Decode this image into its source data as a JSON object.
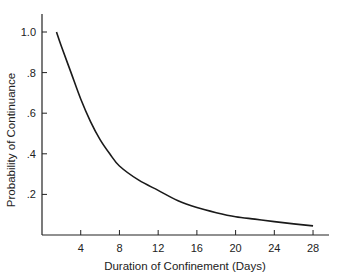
{
  "chart_data": {
    "type": "line",
    "title": "",
    "xlabel": "Duration of Confinement (Days)",
    "ylabel": "Probability of Continuance",
    "xlim": [
      0,
      29.5
    ],
    "ylim": [
      0,
      1.1
    ],
    "x_ticks": [
      4,
      8,
      12,
      16,
      20,
      24,
      28
    ],
    "x_tick_labels": [
      "4",
      "8",
      "12",
      "16",
      "20",
      "24",
      "28"
    ],
    "y_ticks": [
      0.2,
      0.4,
      0.6,
      0.8,
      1.0
    ],
    "y_tick_labels": [
      ".2",
      ".4",
      ".6",
      ".8",
      "1.0"
    ],
    "grid": false,
    "legend": null,
    "series": [
      {
        "name": "Probability of Continuance",
        "color": "#1a1a1a",
        "x": [
          1.5,
          2,
          3,
          4,
          5,
          6,
          7,
          8,
          10,
          12,
          14,
          16,
          18,
          20,
          22,
          24,
          26,
          28
        ],
        "y": [
          1.0,
          0.93,
          0.8,
          0.67,
          0.56,
          0.47,
          0.4,
          0.34,
          0.27,
          0.22,
          0.17,
          0.135,
          0.11,
          0.09,
          0.078,
          0.066,
          0.055,
          0.045
        ]
      }
    ]
  }
}
